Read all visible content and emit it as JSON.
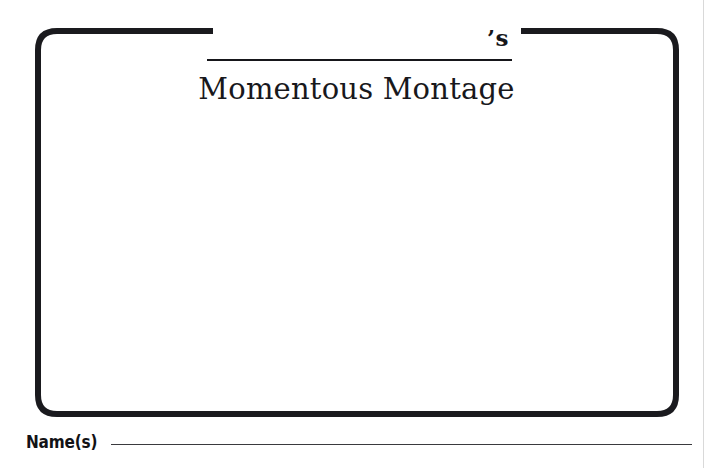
{
  "page": {
    "type": "worksheet-handout",
    "background_color": "#ffffff",
    "ink_color": "#16161a"
  },
  "frame": {
    "name": "decorative-border",
    "style": "concave-notched-corners",
    "stroke_color": "#1a1a1e",
    "stroke_width_px": 6,
    "corner_radius_px": 22,
    "left_px": 35,
    "top_px": 28,
    "width_px": 644,
    "height_px": 389
  },
  "title": {
    "blank_line_label": "",
    "possessive": "’s",
    "main": "Momentous Montage",
    "blank_line_width_px": 305
  },
  "footer": {
    "name_label": "Name(s)",
    "name_blank_value": ""
  }
}
